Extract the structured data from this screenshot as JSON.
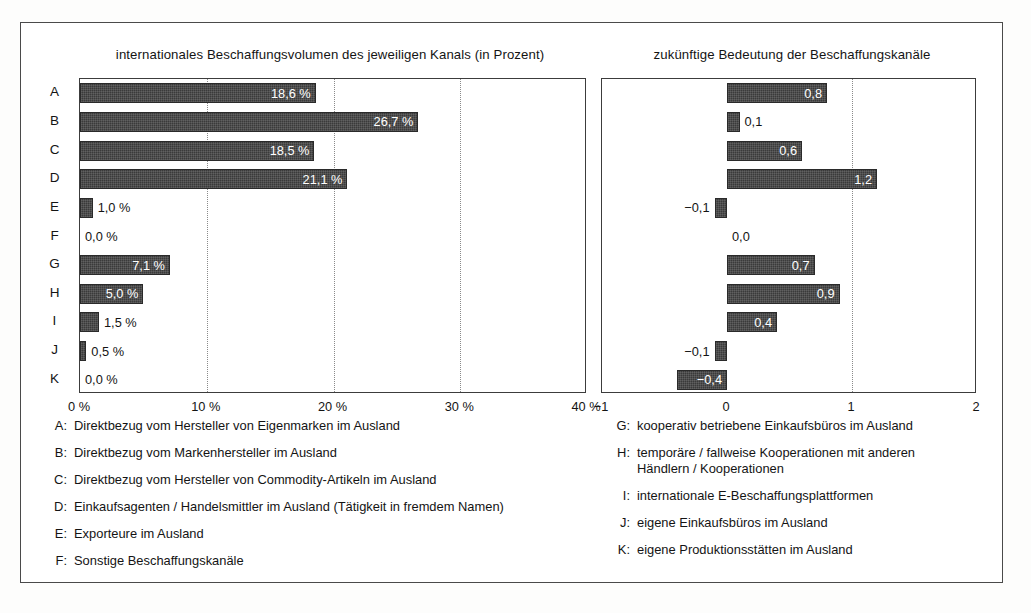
{
  "chart_data": [
    {
      "type": "bar",
      "orientation": "horizontal",
      "title": "internationales Beschaffungsvolumen des jeweiligen Kanals (in Prozent)",
      "categories": [
        "A",
        "B",
        "C",
        "D",
        "E",
        "F",
        "G",
        "H",
        "I",
        "J",
        "K"
      ],
      "values": [
        18.6,
        26.7,
        18.5,
        21.1,
        1.0,
        0.0,
        7.1,
        5.0,
        1.5,
        0.5,
        0.0
      ],
      "value_labels": [
        "18,6 %",
        "26,7 %",
        "18,5 %",
        "21,1 %",
        "1,0 %",
        "0,0 %",
        "7,1 %",
        "5,0 %",
        "1,5 %",
        "0,5 %",
        "0,0 %"
      ],
      "label_placement": [
        "inside",
        "inside",
        "inside",
        "inside",
        "outside",
        "outside",
        "inside",
        "inside",
        "outside",
        "outside",
        "outside"
      ],
      "xlabel": "",
      "ylabel": "",
      "xlim": [
        0,
        40
      ],
      "xticks": [
        0,
        10,
        20,
        30,
        40
      ],
      "xticklabels": [
        "0 %",
        "10 %",
        "20 %",
        "30 %",
        "40 %"
      ],
      "grid": "vertical-dotted-at-10-20-30",
      "legend_position": "below"
    },
    {
      "type": "bar",
      "orientation": "horizontal",
      "title": "zukünftige Bedeutung der Beschaffungskanäle",
      "categories": [
        "A",
        "B",
        "C",
        "D",
        "E",
        "F",
        "G",
        "H",
        "I",
        "J",
        "K"
      ],
      "values": [
        0.8,
        0.1,
        0.6,
        1.2,
        -0.1,
        0.0,
        0.7,
        0.9,
        0.4,
        -0.1,
        -0.4
      ],
      "value_labels": [
        "0,8",
        "0,1",
        "0,6",
        "1,2",
        "−0,1",
        "0,0",
        "0,7",
        "0,9",
        "0,4",
        "−0,1",
        "−0,4"
      ],
      "label_placement": [
        "inside",
        "outside",
        "inside",
        "inside",
        "outside",
        "outside",
        "inside",
        "inside",
        "inside",
        "outside",
        "inside"
      ],
      "xlabel": "",
      "ylabel": "",
      "xlim": [
        -1,
        2
      ],
      "xticks": [
        -1,
        0,
        1,
        2
      ],
      "xticklabels": [
        "−1",
        "0",
        "1",
        "2"
      ],
      "grid": "vertical-dotted-at-1",
      "legend_position": "below"
    }
  ],
  "titles": {
    "left": "internationales Beschaffungsvolumen des jeweiligen Kanals (in Prozent)",
    "right": "zukünftige Bedeutung der Beschaffungskanäle"
  },
  "legend": {
    "left": [
      {
        "key": "A:",
        "text": "Direktbezug vom Hersteller von Eigenmarken im Ausland",
        "cont": ""
      },
      {
        "key": "B:",
        "text": "Direktbezug vom Markenhersteller im Ausland",
        "cont": ""
      },
      {
        "key": "C:",
        "text": "Direktbezug vom Hersteller von Commodity-Artikeln im Ausland",
        "cont": ""
      },
      {
        "key": "D:",
        "text": "Einkaufsagenten / Handelsmittler im Ausland (Tätigkeit in fremdem Namen)",
        "cont": ""
      },
      {
        "key": "E:",
        "text": "Exporteure im Ausland",
        "cont": ""
      },
      {
        "key": "F:",
        "text": "Sonstige Beschaffungskanäle",
        "cont": ""
      }
    ],
    "right": [
      {
        "key": "G:",
        "text": "kooperativ betriebene Einkaufsbüros im Ausland",
        "cont": ""
      },
      {
        "key": "H:",
        "text": "temporäre / fallweise Kooperationen mit anderen",
        "cont": "Händlern / Kooperationen"
      },
      {
        "key": "I:",
        "text": "internationale E-Beschaffungsplattformen",
        "cont": ""
      },
      {
        "key": "J:",
        "text": "eigene Einkaufsbüros im Ausland",
        "cont": ""
      },
      {
        "key": "K:",
        "text": "eigene Produktionsstätten im Ausland",
        "cont": ""
      }
    ]
  },
  "colors": {
    "bar": "#3a3a3a",
    "frame": "#4a4a4a",
    "grid": "#8a8a8a",
    "text": "#141414",
    "label_inside": "#ffffff"
  }
}
